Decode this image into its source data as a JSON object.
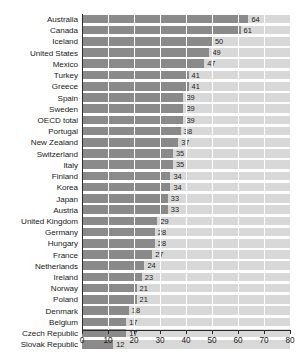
{
  "chart_data": {
    "type": "bar",
    "orientation": "horizontal",
    "title": "",
    "subtitle": "",
    "xlabel": "",
    "ylabel": "",
    "xlim": [
      0,
      80
    ],
    "xticks": [
      0,
      10,
      20,
      30,
      40,
      50,
      60,
      70,
      80
    ],
    "xtick_labels": [
      "0",
      "10",
      "20",
      "30",
      "40",
      "50",
      "60",
      "70",
      "80"
    ],
    "grid": "vertical",
    "legend": "none",
    "bar_color": "#8a8a8a",
    "band_color": "#d8d8d8",
    "categories": [
      "Australia",
      "Canada",
      "Iceland",
      "United States",
      "Mexico",
      "Turkey",
      "Greece",
      "Spain",
      "Sweden",
      "OECD total",
      "Portugal",
      "New Zealand",
      "Switzerland",
      "Italy",
      "Finland",
      "Korea",
      "Japan",
      "Austria",
      "United Kingdom",
      "Germany",
      "Hungary",
      "France",
      "Netherlands",
      "Ireland",
      "Norway",
      "Poland",
      "Denmark",
      "Belgium",
      "Czech Republic",
      "Slovak Republic"
    ],
    "values": [
      64,
      61,
      50,
      49,
      47,
      41,
      41,
      39,
      39,
      39,
      38,
      37,
      35,
      35,
      34,
      34,
      33,
      33,
      29,
      28,
      28,
      27,
      24,
      23,
      21,
      21,
      18,
      17,
      17,
      12
    ],
    "value_labels": [
      "64",
      "61",
      "50",
      "49",
      "47",
      "41",
      "41",
      "39",
      "39",
      "39",
      "38",
      "37",
      "35",
      "35",
      "34",
      "34",
      "33",
      "33",
      "29",
      "28",
      "28",
      "27",
      "24",
      "23",
      "21",
      "21",
      "18",
      "17",
      "17",
      "12"
    ]
  }
}
